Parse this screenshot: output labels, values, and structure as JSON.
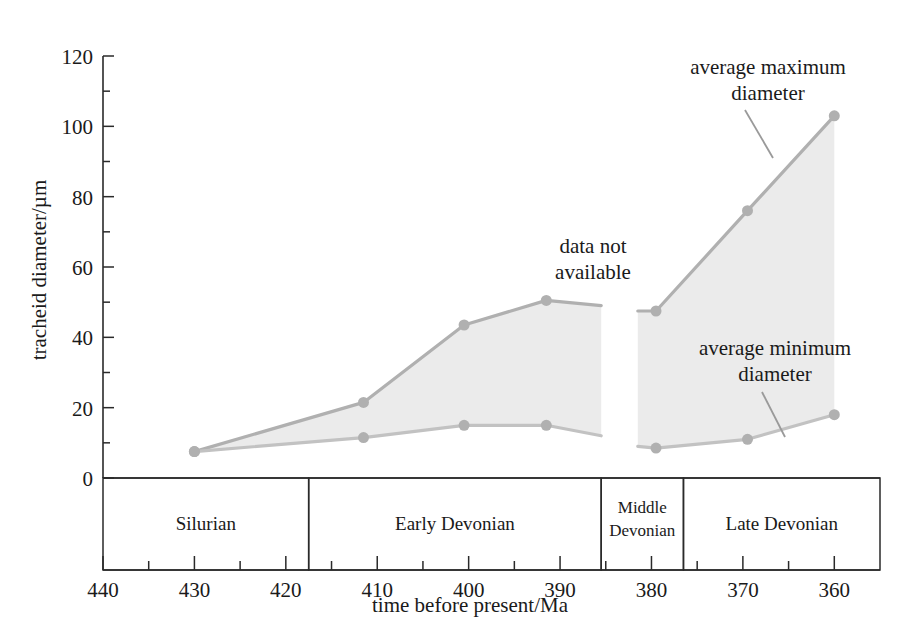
{
  "chart_data": {
    "type": "line",
    "title": "",
    "xlabel": "time before present/Ma",
    "ylabel": "tracheid diameter/µm",
    "xlim": [
      440,
      355
    ],
    "ylim": [
      0,
      120
    ],
    "x_ticks": [
      440,
      430,
      420,
      410,
      400,
      390,
      380,
      370,
      360
    ],
    "x_tick_labels": [
      "440",
      "430",
      "420",
      "410",
      "400",
      "390",
      "380",
      "370",
      "360"
    ],
    "x_minor_ticks": [
      435,
      425,
      415,
      405,
      395,
      385,
      375,
      365
    ],
    "y_ticks": [
      0,
      20,
      40,
      60,
      80,
      100,
      120
    ],
    "y_tick_labels": [
      "0",
      "20",
      "40",
      "60",
      "80",
      "100",
      "120"
    ],
    "y_minor_ticks": [
      10,
      30,
      50,
      70,
      90,
      110
    ],
    "grid": false,
    "legend_position": "annotations-inline",
    "series": [
      {
        "name": "average maximum diameter",
        "color": "#b0b0b0",
        "segments": [
          {
            "name": "pre-gap",
            "x": [
              430,
              411.5,
              400.5,
              391.5,
              385.5
            ],
            "y": [
              7.5,
              21.5,
              43.5,
              50.5,
              49
            ]
          },
          {
            "name": "post-gap",
            "x": [
              381.5,
              379.5,
              369.5,
              360
            ],
            "y": [
              47.5,
              47.5,
              76,
              103
            ]
          }
        ]
      },
      {
        "name": "average minimum diameter",
        "color": "#c2c2c2",
        "segments": [
          {
            "name": "pre-gap",
            "x": [
              430,
              411.5,
              400.5,
              391.5,
              385.5
            ],
            "y": [
              7.5,
              11.5,
              15,
              15,
              12
            ]
          },
          {
            "name": "post-gap",
            "x": [
              381.5,
              379.5,
              369.5,
              360
            ],
            "y": [
              9,
              8.5,
              11,
              18
            ]
          }
        ]
      }
    ],
    "band_fill_color": "#ebebeb",
    "annotations": [
      {
        "name": "average-maximum-diameter",
        "text_lines": [
          "average maximum",
          "diameter"
        ]
      },
      {
        "name": "average-minimum-diameter",
        "text_lines": [
          "average minimum",
          "diameter"
        ]
      },
      {
        "name": "data-not-available",
        "text_lines": [
          "data not",
          "available"
        ]
      }
    ],
    "periods": [
      {
        "name": "silurian",
        "label": "Silurian",
        "start": 440,
        "end": 417.5
      },
      {
        "name": "early-devonian",
        "label": "Early Devonian",
        "start": 417.5,
        "end": 385.5
      },
      {
        "name": "middle-devonian",
        "label_lines": [
          "Middle",
          "Devonian"
        ],
        "start": 385.5,
        "end": 376.5
      },
      {
        "name": "late-devonian",
        "label": "Late Devonian",
        "start": 376.5,
        "end": 355
      }
    ]
  },
  "axes": {
    "y_title": "tracheid diameter/µm",
    "x_title": "time before present/Ma",
    "y_labels": [
      "120",
      "100",
      "80",
      "60",
      "40",
      "20",
      "0"
    ],
    "x_labels": [
      "440",
      "430",
      "420",
      "410",
      "400",
      "390",
      "380",
      "370",
      "360"
    ]
  },
  "labels": {
    "annotation_max_line1": "average maximum",
    "annotation_max_line2": "diameter",
    "annotation_min_line1": "average minimum",
    "annotation_min_line2": "diameter",
    "annotation_gap_line1": "data not",
    "annotation_gap_line2": "available",
    "period_silurian": "Silurian",
    "period_early_devonian": "Early Devonian",
    "period_middle_devonian_line1": "Middle",
    "period_middle_devonian_line2": "Devonian",
    "period_late_devonian": "Late Devonian"
  },
  "colors": {
    "series_max": "#b0b0b0",
    "series_min": "#c2c2c2",
    "band": "#ebebeb",
    "axis": "#2a2a2a",
    "text": "#1a1a1a",
    "background": "#ffffff"
  }
}
